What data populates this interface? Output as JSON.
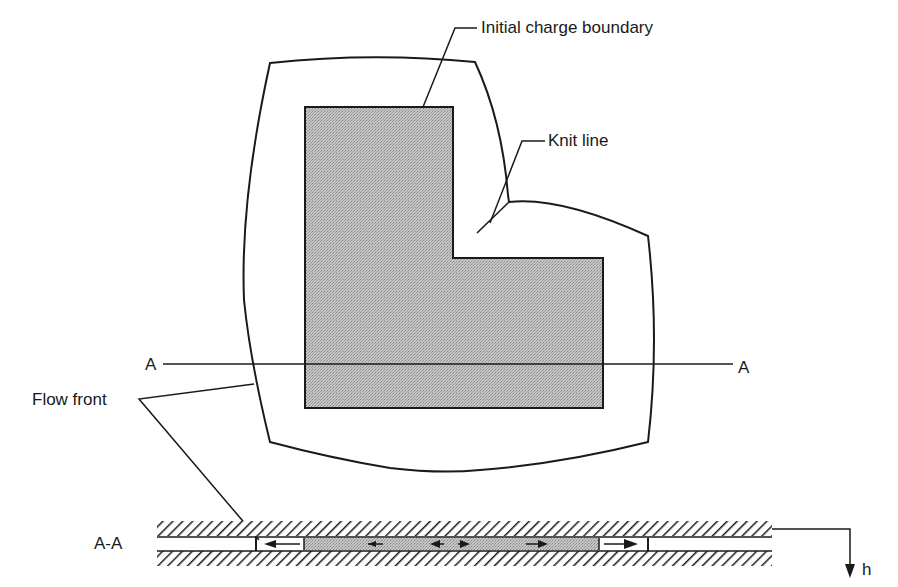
{
  "figure": {
    "type": "compression-molding flow diagram",
    "labels": {
      "initial_charge_boundary": "Initial charge boundary",
      "knit_line": "Knit line",
      "flow_front": "Flow front",
      "section_left": "A",
      "section_right": "A",
      "section_view": "A-A",
      "thickness": "h"
    },
    "colors": {
      "line": "#1a1a1a",
      "charge_fill": "#b8b8b8",
      "background": "#ffffff"
    },
    "plan_view": {
      "charge_shape": "L-shaped",
      "charge_polygon": [
        [
          305,
          107
        ],
        [
          453,
          107
        ],
        [
          453,
          258
        ],
        [
          603,
          258
        ],
        [
          603,
          408
        ],
        [
          305,
          408
        ]
      ],
      "section_line_y": 365
    },
    "cross_section": {
      "flow_arrows": [
        "left",
        "left-small",
        "left-small",
        "right-small",
        "right-small",
        "right"
      ]
    }
  }
}
